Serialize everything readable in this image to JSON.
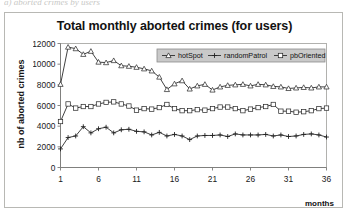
{
  "caption_strip": "a) aborted crimes by users",
  "chart": {
    "title": "Total monthly aborted crimes (for users)",
    "y_axis_title": "nb of aborted crimes",
    "x_unit_label": "months",
    "legend": [
      {
        "label": "hotSpot",
        "marker": "triangle"
      },
      {
        "label": "randomPatrol",
        "marker": "plus"
      },
      {
        "label": "pbOriented",
        "marker": "square"
      }
    ],
    "y_ticks": [
      "0",
      "2000",
      "4000",
      "6000",
      "8000",
      "10000",
      "12000"
    ],
    "x_ticks": [
      "1",
      "6",
      "11",
      "16",
      "21",
      "26",
      "31",
      "36"
    ]
  },
  "chart_data": {
    "type": "line",
    "title": "Total monthly aborted crimes (for users)",
    "xlabel": "months",
    "ylabel": "nb of aborted crimes",
    "xlim": [
      1,
      36
    ],
    "ylim": [
      0,
      12000
    ],
    "ytick_values": [
      0,
      2000,
      4000,
      6000,
      8000,
      10000,
      12000
    ],
    "xtick_values": [
      1,
      6,
      11,
      16,
      21,
      26,
      31,
      36
    ],
    "grid": false,
    "legend_position": "top-right",
    "x": [
      1,
      2,
      3,
      4,
      5,
      6,
      7,
      8,
      9,
      10,
      11,
      12,
      13,
      14,
      15,
      16,
      17,
      18,
      19,
      20,
      21,
      22,
      23,
      24,
      25,
      26,
      27,
      28,
      29,
      30,
      31,
      32,
      33,
      34,
      35,
      36
    ],
    "series": [
      {
        "name": "hotSpot",
        "marker": "triangle",
        "values": [
          8050,
          11650,
          11500,
          10950,
          11250,
          10200,
          10150,
          10350,
          9850,
          9800,
          9700,
          9550,
          9350,
          8750,
          7550,
          8100,
          8400,
          7600,
          7900,
          8050,
          7500,
          7800,
          7950,
          8000,
          8050,
          7900,
          8050,
          8000,
          7850,
          7800,
          7650,
          7700,
          7750,
          7700,
          7800,
          7800
        ]
      },
      {
        "name": "randomPatrol",
        "marker": "plus",
        "values": [
          1800,
          2900,
          3050,
          3950,
          3350,
          3750,
          3900,
          3350,
          3650,
          3700,
          3500,
          3450,
          3150,
          3400,
          3050,
          3200,
          3050,
          2700,
          3050,
          3100,
          3100,
          3150,
          3000,
          3250,
          3150,
          3150,
          3150,
          3200,
          3050,
          3150,
          3000,
          3050,
          3200,
          3250,
          3150,
          2950
        ]
      },
      {
        "name": "pbOriented",
        "marker": "square",
        "values": [
          4450,
          6150,
          5750,
          5900,
          5900,
          6150,
          6300,
          6350,
          6150,
          5950,
          5550,
          5700,
          5650,
          5800,
          6100,
          5700,
          5500,
          5500,
          5600,
          5550,
          5700,
          5850,
          5850,
          5700,
          5500,
          5650,
          5800,
          5900,
          6100,
          5450,
          5450,
          5350,
          5400,
          5500,
          5700,
          5750
        ]
      }
    ]
  }
}
